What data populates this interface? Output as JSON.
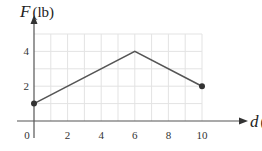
{
  "chart_data": {
    "type": "line",
    "title": "",
    "xlabel": "d(ft)",
    "ylabel": "F(lb)",
    "x_var": "d",
    "x_unit": "ft",
    "y_var": "F",
    "y_unit": "lb",
    "x": [
      0,
      6,
      10
    ],
    "series": [
      {
        "name": "F(d)",
        "values": [
          1,
          4,
          2
        ]
      }
    ],
    "points": [
      [
        0,
        1
      ],
      [
        6,
        4
      ],
      [
        10,
        2
      ]
    ],
    "endpoints_marked": [
      [
        0,
        1
      ],
      [
        10,
        2
      ]
    ],
    "xlim": [
      0,
      10
    ],
    "ylim": [
      0,
      5
    ],
    "x_ticks": [
      "0",
      "2",
      "4",
      "6",
      "8",
      "10"
    ],
    "y_ticks": [
      "2",
      "4"
    ],
    "grid": true,
    "legend": null
  },
  "colors": {
    "line": "#555555",
    "grid": "#e3e3e3",
    "axis": "#555555",
    "text": "#333333"
  }
}
